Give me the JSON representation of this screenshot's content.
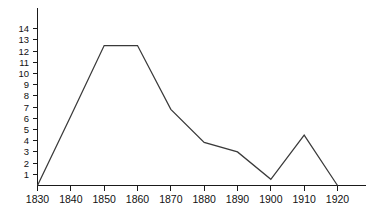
{
  "chart_data": {
    "type": "line",
    "title": "",
    "subtitle": "",
    "xlabel": "",
    "ylabel": "",
    "x": [
      1830,
      1840,
      1850,
      1860,
      1870,
      1880,
      1890,
      1900,
      1910,
      1920
    ],
    "categories": [
      "1830",
      "1840",
      "1850",
      "1860",
      "1870",
      "1880",
      "1890",
      "1900",
      "1910",
      "1920"
    ],
    "values": [
      0,
      6.2,
      12.5,
      12.5,
      6.8,
      3.85,
      3.0,
      0.55,
      4.5,
      0
    ],
    "series": [
      {
        "name": "",
        "values": [
          0,
          6.2,
          12.5,
          12.5,
          6.8,
          3.85,
          3.0,
          0.55,
          4.5,
          0
        ]
      }
    ],
    "xlim": [
      1830,
      1920
    ],
    "ylim": [
      0,
      14.6
    ],
    "xticks": [
      1830,
      1840,
      1850,
      1860,
      1870,
      1880,
      1890,
      1900,
      1910,
      1920
    ],
    "xticklabels": [
      "1830",
      "1840",
      "1850",
      "1860",
      "1870",
      "1880",
      "1890",
      "1900",
      "1910",
      "1920"
    ],
    "yticks": [
      1,
      2,
      3,
      4,
      5,
      6,
      7,
      8,
      9,
      10,
      11,
      12,
      13,
      14
    ],
    "yticklabels": [
      "1",
      "2",
      "3",
      "4",
      "5",
      "6",
      "7",
      "8",
      "9",
      "10",
      "11",
      "12",
      "13",
      "14"
    ],
    "grid": false,
    "legend": false,
    "legend_position": "none",
    "line_color": "#3a3a3a",
    "axis_color": "#1a1a1a",
    "background_color": "#ffffff"
  }
}
